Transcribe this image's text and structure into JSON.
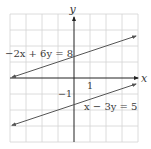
{
  "figure": {
    "type": "coordinate-plane-graph",
    "axes": {
      "x_label": "x",
      "y_label": "y",
      "x_tick_label": "1",
      "y_tick_label": "−1",
      "x_range": [
        -4,
        4
      ],
      "y_range": [
        -4,
        4
      ],
      "grid": true,
      "unit_px": 16
    },
    "lines": [
      {
        "equation": "−2x + 6y = 8",
        "slope": 0.3333,
        "intercept": 1.3333,
        "from": [
          -4,
          0
        ],
        "to": [
          4,
          2.6667
        ],
        "color": "#555555"
      },
      {
        "equation": "x − 3y = 5",
        "slope": 0.3333,
        "intercept": -1.6667,
        "from": [
          -4,
          -3
        ],
        "to": [
          4,
          -0.3333
        ],
        "color": "#555555"
      }
    ],
    "colors": {
      "grid": "#cfcfcf",
      "axis": "#222222",
      "line": "#555555",
      "text": "#3a3a3a"
    }
  }
}
